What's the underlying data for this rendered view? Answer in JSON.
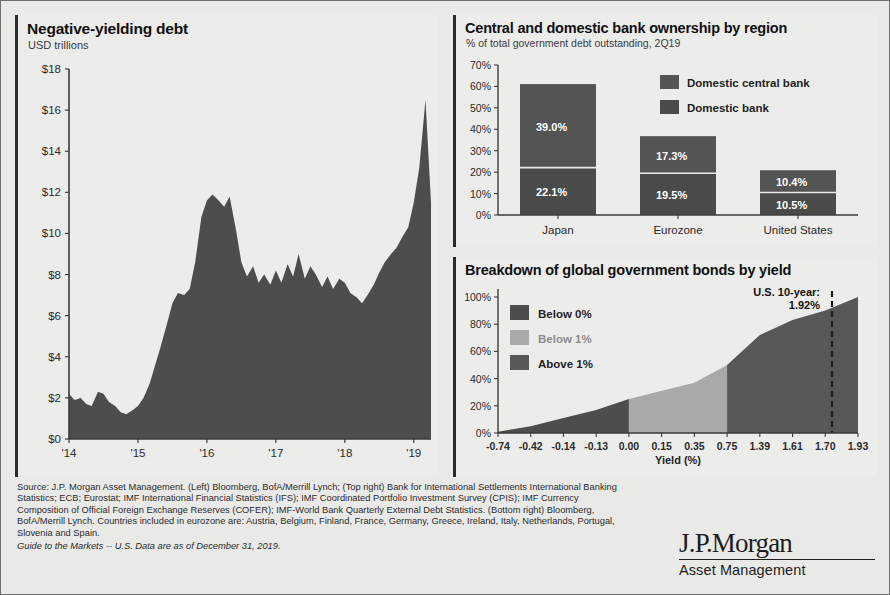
{
  "left_panel": {
    "title": "Negative-yielding debt",
    "subtitle": "USD trillions"
  },
  "top_right_panel": {
    "title": "Central and domestic bank ownership by region",
    "subtitle": "% of total government debt outstanding, 2Q19"
  },
  "bottom_right_panel": {
    "title": "Breakdown of global government bonds by yield",
    "annotation_line1": "U.S. 10-year:",
    "annotation_line2": "1.92%"
  },
  "footer": {
    "source_line1": "Source: J.P. Morgan Asset Management. (Left) Bloomberg, BofA/Merrill Lynch; (Top right) Bank for International Settlements International Banking",
    "source_line2": "Statistics; ECB; Eurostat; IMF International Financial Statistics (IFS); IMF Coordinated Portfolio Investment Survey (CPIS); IMF Currency",
    "source_line3": "Composition of Official Foreign Exchange Reserves (COFER); IMF-World Bank Quarterly External Debt Statistics. (Bottom right) Bloomberg,",
    "source_line4": "BofA/Merrill Lynch. Countries included in eurozone are: Austria, Belgium, Finland, France, Germany, Greece, Ireland, Italy, Netherlands, Portugal,",
    "source_line5": "Slovenia and Spain.",
    "guide_line": "Guide to the Markets -- U.S. Data are as of December 31, 2019."
  },
  "logo": {
    "brand": "J.P.Morgan",
    "tagline": "Asset Management"
  },
  "colors": {
    "dark": "#4d4d4d",
    "darker": "#3f3f3f",
    "light_gray": "#a9a9a9",
    "axis": "#3c3c3c",
    "panel_bg": "#ececeb"
  },
  "chart_data": [
    {
      "type": "area",
      "title": "Negative-yielding debt",
      "ylabel": "USD trillions",
      "xlabel": "",
      "ylim": [
        0,
        18
      ],
      "yticks": [
        "$0",
        "$2",
        "$4",
        "$6",
        "$8",
        "$10",
        "$12",
        "$14",
        "$16",
        "$18"
      ],
      "ytick_values": [
        0,
        2,
        4,
        6,
        8,
        10,
        12,
        14,
        16,
        18
      ],
      "xticks": [
        "'14",
        "'15",
        "'16",
        "'17",
        "'18",
        "'19"
      ],
      "xtick_values": [
        2014.0,
        2015.0,
        2016.0,
        2017.0,
        2018.0,
        2019.0
      ],
      "xlim": [
        2014.0,
        2019.25
      ],
      "grid": false,
      "legend": "none",
      "x": [
        2014.0,
        2014.08,
        2014.17,
        2014.25,
        2014.33,
        2014.42,
        2014.5,
        2014.58,
        2014.67,
        2014.75,
        2014.83,
        2014.92,
        2015.0,
        2015.08,
        2015.17,
        2015.25,
        2015.33,
        2015.42,
        2015.5,
        2015.58,
        2015.67,
        2015.75,
        2015.83,
        2015.92,
        2016.0,
        2016.08,
        2016.17,
        2016.25,
        2016.33,
        2016.42,
        2016.5,
        2016.58,
        2016.67,
        2016.75,
        2016.83,
        2016.92,
        2017.0,
        2017.08,
        2017.17,
        2017.25,
        2017.33,
        2017.42,
        2017.5,
        2017.58,
        2017.67,
        2017.75,
        2017.83,
        2017.92,
        2018.0,
        2018.08,
        2018.17,
        2018.25,
        2018.33,
        2018.42,
        2018.5,
        2018.58,
        2018.67,
        2018.75,
        2018.83,
        2018.92,
        2019.0,
        2019.08,
        2019.17,
        2019.25
      ],
      "values": [
        2.2,
        1.9,
        2.0,
        1.7,
        1.6,
        2.3,
        2.2,
        1.8,
        1.6,
        1.3,
        1.2,
        1.4,
        1.6,
        2.0,
        2.7,
        3.6,
        4.5,
        5.6,
        6.6,
        7.1,
        7.0,
        7.3,
        8.6,
        10.8,
        11.6,
        11.9,
        11.6,
        11.3,
        11.8,
        10.2,
        8.6,
        7.9,
        8.4,
        7.6,
        8.0,
        7.5,
        8.2,
        7.6,
        8.5,
        7.9,
        9.0,
        7.8,
        8.4,
        8.0,
        7.4,
        7.9,
        7.3,
        7.8,
        7.6,
        7.1,
        6.9,
        6.6,
        7.0,
        7.5,
        8.1,
        8.6,
        9.0,
        9.3,
        9.8,
        10.3,
        11.5,
        13.2,
        16.5,
        11.5
      ]
    },
    {
      "type": "bar",
      "title": "Central and domestic bank ownership by region",
      "subtitle": "% of total government debt outstanding, 2Q19",
      "xlabel": "",
      "ylabel": "",
      "ylim": [
        0,
        70
      ],
      "yticks": [
        "0%",
        "10%",
        "20%",
        "30%",
        "40%",
        "50%",
        "60%",
        "70%"
      ],
      "ytick_values": [
        0,
        10,
        20,
        30,
        40,
        50,
        60,
        70
      ],
      "categories": [
        "Japan",
        "Eurozone",
        "United States"
      ],
      "stacked": true,
      "legend_position": "top-right",
      "series": [
        {
          "name": "Domestic bank",
          "values": [
            22.1,
            19.5,
            10.5
          ],
          "labels": [
            "22.1%",
            "19.5%",
            "10.5%"
          ],
          "color": "#4a4a4a"
        },
        {
          "name": "Domestic central bank",
          "values": [
            39.0,
            17.3,
            10.4
          ],
          "labels": [
            "39.0%",
            "17.3%",
            "10.4%"
          ],
          "color": "#545454"
        }
      ],
      "totals": [
        61.1,
        36.8,
        20.9
      ]
    },
    {
      "type": "area",
      "title": "Breakdown of global government bonds by yield",
      "xlabel": "Yield (%)",
      "ylabel": "",
      "ylim": [
        0,
        100
      ],
      "yticks": [
        "0%",
        "20%",
        "40%",
        "60%",
        "80%",
        "100%"
      ],
      "ytick_values": [
        0,
        20,
        40,
        60,
        80,
        100
      ],
      "xticks": [
        "-0.74",
        "-0.42",
        "-0.14",
        "-0.13",
        "0.00",
        "0.15",
        "0.35",
        "0.75",
        "1.39",
        "1.61",
        "1.70",
        "1.93"
      ],
      "xtick_values": [
        -0.74,
        -0.42,
        -0.14,
        -0.13,
        0.0,
        0.15,
        0.35,
        0.75,
        1.39,
        1.61,
        1.7,
        1.93
      ],
      "cumulative": true,
      "bands": [
        {
          "name": "Below 0%",
          "color": "#4d4d4d",
          "x_end": 0.0,
          "y_end": 25
        },
        {
          "name": "Below 1%",
          "color": "#a9a9a9",
          "x_end": 0.75,
          "y_end": 50
        },
        {
          "name": "Above 1%",
          "color": "#585858",
          "x_end": 1.93,
          "y_end": 100
        }
      ],
      "x": [
        0,
        1,
        2,
        3,
        4,
        5,
        6,
        7,
        8,
        9,
        10,
        11
      ],
      "values": [
        1,
        5,
        11,
        17,
        25,
        31,
        37,
        50,
        72,
        83,
        90,
        100
      ],
      "marker_line": {
        "label": "U.S. 10-year: 1.92%",
        "value": 1.92,
        "style": "dashed"
      }
    }
  ]
}
